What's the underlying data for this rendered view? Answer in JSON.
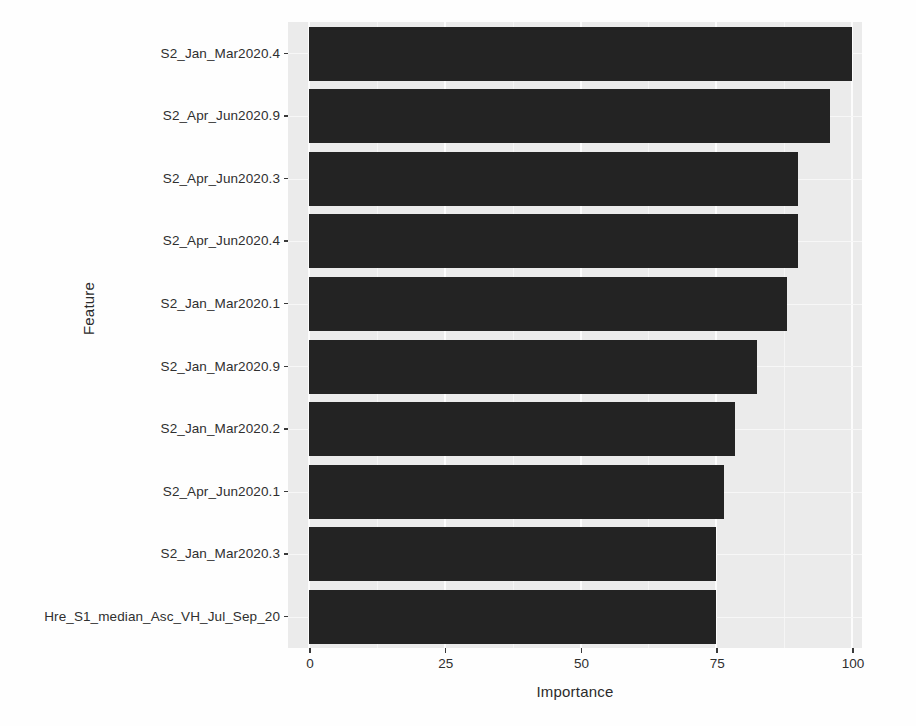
{
  "chart_data": {
    "type": "bar",
    "orientation": "horizontal",
    "title": "",
    "xlabel": "Importance",
    "ylabel": "Feature",
    "xlim": [
      0,
      104
    ],
    "xticks": [
      0,
      25,
      50,
      75,
      100
    ],
    "xtick_labels": [
      "0",
      "25",
      "50",
      "75",
      "100"
    ],
    "grid": true,
    "legend": null,
    "bar_color": "#232323",
    "panel_color": "#ebebeb",
    "gridline_color": "#ffffff",
    "categories": [
      "S2_Jan_Mar2020.4",
      "S2_Apr_Jun2020.9",
      "S2_Apr_Jun2020.3",
      "S2_Apr_Jun2020.4",
      "S2_Jan_Mar2020.1",
      "S2_Jan_Mar2020.9",
      "S2_Jan_Mar2020.2",
      "S2_Apr_Jun2020.1",
      "S2_Jan_Mar2020.3",
      "Hre_S1_median_Asc_VH_Jul_Sep_20"
    ],
    "values": [
      100,
      96,
      90,
      90,
      88,
      82.5,
      78.5,
      76.5,
      75,
      75
    ]
  },
  "axes": {
    "x_title": "Importance",
    "y_title": "Feature"
  }
}
